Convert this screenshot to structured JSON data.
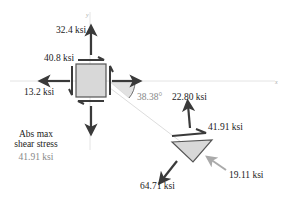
{
  "element_labels": {
    "sigma_y": "32.4 ksi",
    "tau_xy": "40.8 ksi",
    "sigma_x": "13.2 ksi",
    "angle": "38.38°"
  },
  "rotated_labels": {
    "normal_top": "22.80 ksi",
    "shear": "41.91 ksi",
    "normal_right": "19.11 ksi",
    "normal_bottom": "64.71 ksi"
  },
  "info": {
    "title_line1": "Abs max",
    "title_line2": "shear stress",
    "value": "41.91 ksi"
  },
  "axes": {
    "x": "x",
    "y": "y"
  },
  "colors": {
    "arrow": "#3a3a3a",
    "arrow_grey": "#aaaaaa",
    "fill": "#d8d8d8",
    "axis": "#dddddd"
  }
}
